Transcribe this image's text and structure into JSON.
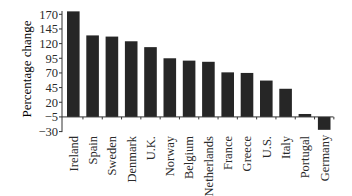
{
  "chart_data": {
    "type": "bar",
    "title": "",
    "xlabel": "",
    "ylabel": "Percentage change",
    "categories": [
      "Ireland",
      "Spain",
      "Sweden",
      "Denmark",
      "U.K.",
      "Norway",
      "Belgium",
      "Netherlands",
      "France",
      "Greece",
      "U.S.",
      "Italy",
      "Portugal",
      "Germany"
    ],
    "values": [
      175,
      134,
      132,
      124,
      114,
      95,
      91,
      89,
      71,
      70,
      57,
      43,
      0,
      -27
    ],
    "yticks": [
      170,
      145,
      120,
      95,
      70,
      45,
      20,
      -5,
      -30
    ],
    "ytick_labels": [
      "170",
      "145",
      "120",
      "95",
      "70",
      "45",
      "20",
      "−5",
      "−30"
    ],
    "ylim": [
      -30,
      175
    ],
    "grid": false,
    "legend": null,
    "bar_color": "#262626",
    "axis_color": "#333333",
    "label_rotation": -90
  }
}
